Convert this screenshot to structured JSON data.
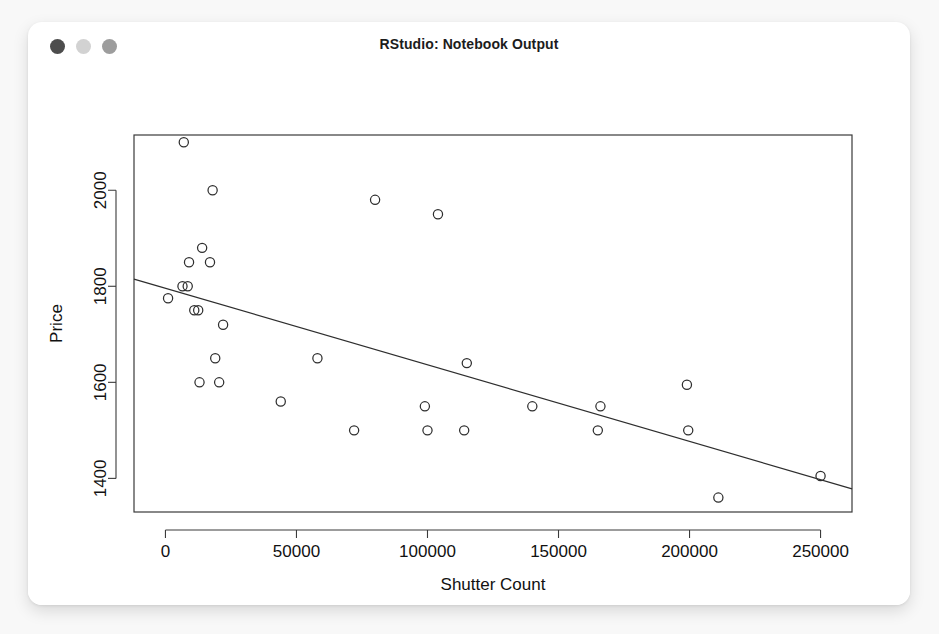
{
  "window": {
    "title": "RStudio: Notebook Output",
    "traffic_lights": [
      {
        "name": "close",
        "color": "#4d4d4d"
      },
      {
        "name": "minimize",
        "color": "#d2d2d2"
      },
      {
        "name": "maximize",
        "color": "#9d9d9d"
      }
    ]
  },
  "chart_data": {
    "type": "scatter",
    "title": "",
    "xlabel": "Shutter Count",
    "ylabel": "Price",
    "xlim": [
      -12000,
      262000
    ],
    "ylim": [
      1330,
      2115
    ],
    "grid": false,
    "legend": null,
    "xticks": [
      0,
      50000,
      100000,
      150000,
      200000,
      250000
    ],
    "xtick_labels": [
      "0",
      "50000",
      "100000",
      "150000",
      "200000",
      "250000"
    ],
    "yticks": [
      1400,
      1600,
      1800,
      2000
    ],
    "ytick_labels": [
      "1400",
      "1600",
      "1800",
      "2000"
    ],
    "marker": "open-circle",
    "marker_color": "#2e2e2e",
    "points": [
      {
        "x": 7000,
        "y": 2100
      },
      {
        "x": 18000,
        "y": 2000
      },
      {
        "x": 80000,
        "y": 1980
      },
      {
        "x": 104000,
        "y": 1950
      },
      {
        "x": 14000,
        "y": 1880
      },
      {
        "x": 9000,
        "y": 1850
      },
      {
        "x": 17000,
        "y": 1850
      },
      {
        "x": 6500,
        "y": 1800
      },
      {
        "x": 8500,
        "y": 1800
      },
      {
        "x": 1000,
        "y": 1775
      },
      {
        "x": 11000,
        "y": 1750
      },
      {
        "x": 12500,
        "y": 1750
      },
      {
        "x": 22000,
        "y": 1720
      },
      {
        "x": 19000,
        "y": 1650
      },
      {
        "x": 58000,
        "y": 1650
      },
      {
        "x": 115000,
        "y": 1640
      },
      {
        "x": 13000,
        "y": 1600
      },
      {
        "x": 20500,
        "y": 1600
      },
      {
        "x": 199000,
        "y": 1595
      },
      {
        "x": 44000,
        "y": 1560
      },
      {
        "x": 99000,
        "y": 1550
      },
      {
        "x": 140000,
        "y": 1550
      },
      {
        "x": 166000,
        "y": 1550
      },
      {
        "x": 72000,
        "y": 1500
      },
      {
        "x": 100000,
        "y": 1500
      },
      {
        "x": 114000,
        "y": 1500
      },
      {
        "x": 165000,
        "y": 1500
      },
      {
        "x": 199500,
        "y": 1500
      },
      {
        "x": 250000,
        "y": 1405
      },
      {
        "x": 211000,
        "y": 1360
      }
    ],
    "fit_line": {
      "type": "linear-regression",
      "x_start": -12000,
      "y_start": 1815,
      "x_end": 262000,
      "y_end": 1378
    }
  }
}
